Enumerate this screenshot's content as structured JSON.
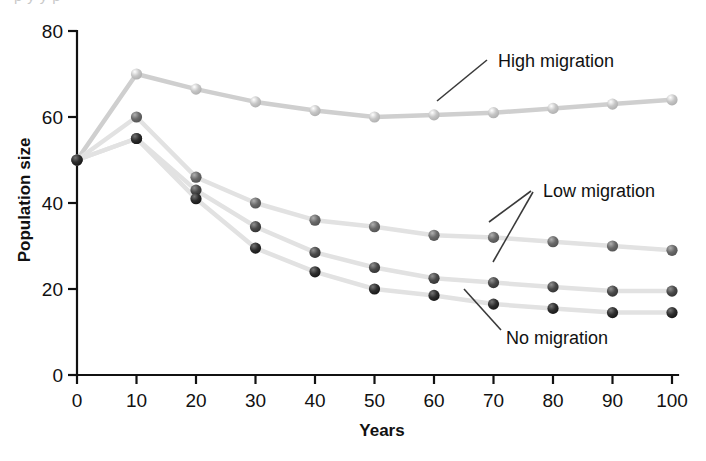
{
  "figure": {
    "top_clipped_text": "p y y p",
    "background_color": "#ffffff"
  },
  "axes": {
    "y_title": "Population size",
    "x_title": "Years",
    "y_ticks": [
      "0",
      "20",
      "40",
      "60",
      "80"
    ],
    "x_ticks": [
      "0",
      "10",
      "20",
      "30",
      "40",
      "50",
      "60",
      "70",
      "80",
      "90",
      "100"
    ]
  },
  "annotations": [
    {
      "name": "high-migration",
      "label": "High migration"
    },
    {
      "name": "low-migration",
      "label": "Low migration"
    },
    {
      "name": "no-migration",
      "label": "No migration"
    }
  ],
  "chart_data": {
    "type": "line",
    "title": "",
    "subtitle": "",
    "xlabel": "Years",
    "ylabel": "Population size",
    "xlim": [
      0,
      100
    ],
    "ylim": [
      0,
      80
    ],
    "x_tick_step": 10,
    "y_tick_step": 20,
    "grid": false,
    "legend": "inline-annotations",
    "x": [
      0,
      10,
      20,
      30,
      40,
      50,
      60,
      70,
      80,
      90,
      100
    ],
    "series": [
      {
        "name": "High migration",
        "color": "#cfcfcf",
        "marker_color": "#c6c6c6",
        "values": [
          50,
          70,
          66.5,
          63.5,
          61.5,
          60,
          60.5,
          61,
          62,
          63,
          64
        ]
      },
      {
        "name": "Low migration (upper)",
        "color": "#e2e2e2",
        "marker_color": "#6a6a6a",
        "values": [
          50,
          60,
          46,
          40,
          36,
          34.5,
          32.5,
          32,
          31,
          30,
          29
        ]
      },
      {
        "name": "Low migration (lower)",
        "color": "#e2e2e2",
        "marker_color": "#4a4a4a",
        "values": [
          50,
          55,
          43,
          34.5,
          28.5,
          25,
          22.5,
          21.5,
          20.5,
          19.5,
          19.5
        ]
      },
      {
        "name": "No migration",
        "color": "#e2e2e2",
        "marker_color": "#2e2e2e",
        "values": [
          50,
          55,
          41,
          29.5,
          24,
          20,
          18.5,
          16.5,
          15.5,
          14.5,
          14.5
        ]
      }
    ],
    "annotation_targets": [
      {
        "label": "High migration",
        "series": "High migration",
        "x": 53
      },
      {
        "label": "Low migration",
        "series": "Low migration (upper)",
        "x": 62
      },
      {
        "label": "Low migration",
        "series": "Low migration (lower)",
        "x": 62
      },
      {
        "label": "No migration",
        "series": "No migration",
        "x": 62
      }
    ]
  }
}
